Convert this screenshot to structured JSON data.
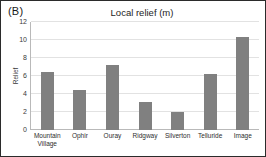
{
  "figure": {
    "panel_label": "(B)"
  },
  "chart_data": {
    "type": "bar",
    "title": "Local relief (m)",
    "xlabel": "",
    "ylabel": "Relief",
    "categories": [
      "Mountain Village",
      "Ophir",
      "Ouray",
      "Ridgway",
      "Silverton",
      "Telluride",
      "Image"
    ],
    "values": [
      6.4,
      4.5,
      7.2,
      3.1,
      2.0,
      6.2,
      10.3
    ],
    "ylim": [
      0,
      12
    ],
    "yticks": [
      12,
      10,
      8,
      6,
      4,
      2,
      0
    ],
    "ytick_labels": [
      "12",
      "10",
      "8",
      "6",
      "4",
      "2",
      "0"
    ],
    "grid": true,
    "legend": false,
    "bar_color": "#808080",
    "gridline_color": "#e2e2e2",
    "axis_color": "#b9b9b9"
  }
}
